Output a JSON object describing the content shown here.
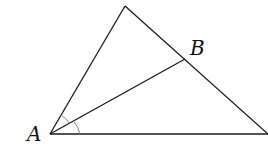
{
  "diagram": {
    "type": "triangle-angle-bisector",
    "labels": {
      "a": "A",
      "b": "B"
    },
    "points": {
      "A": [
        50,
        134
      ],
      "apex": [
        125,
        6
      ],
      "B": [
        185,
        59
      ],
      "right": [
        268,
        134
      ]
    },
    "angle_marks": 2,
    "stroke_color": "#1a1a1a",
    "arc_color": "#888888"
  }
}
